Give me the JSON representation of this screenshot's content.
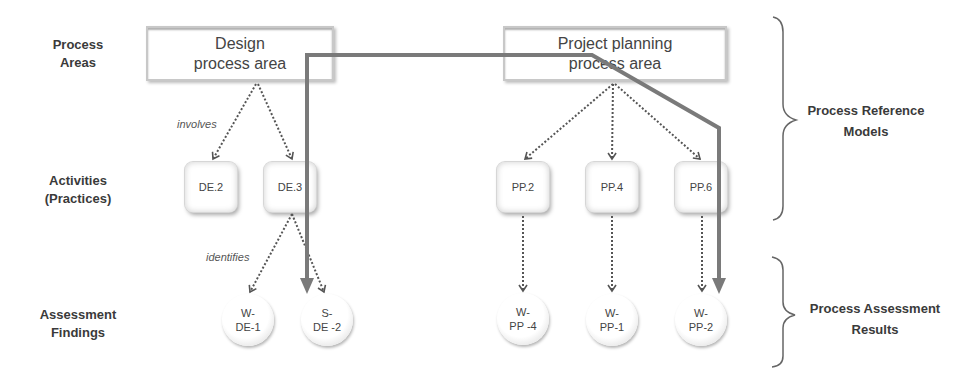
{
  "row_labels": {
    "process_areas": [
      "Process",
      "Areas"
    ],
    "activities": [
      "Activities",
      "(Practices)"
    ],
    "findings": [
      "Assessment",
      "Findings"
    ]
  },
  "process_areas": [
    {
      "id": "design",
      "lines": [
        "Design",
        "process area"
      ]
    },
    {
      "id": "project_planning",
      "lines": [
        "Project planning",
        "process area"
      ]
    }
  ],
  "activities": [
    {
      "id": "DE.2",
      "label": "DE.2",
      "parent": "design"
    },
    {
      "id": "DE.3",
      "label": "DE.3",
      "parent": "design"
    },
    {
      "id": "PP.2",
      "label": "PP.2",
      "parent": "project_planning"
    },
    {
      "id": "PP.4",
      "label": "PP.4",
      "parent": "project_planning"
    },
    {
      "id": "PP.6",
      "label": "PP.6",
      "parent": "project_planning"
    }
  ],
  "findings": [
    {
      "id": "W-DE-1",
      "lines": [
        "W-",
        "DE-1"
      ],
      "source": "DE.3"
    },
    {
      "id": "S-DE-2",
      "lines": [
        "S-",
        "DE -2"
      ],
      "source": "DE.3"
    },
    {
      "id": "W-PP-4",
      "lines": [
        "W-",
        "PP -4"
      ],
      "source": "PP.2"
    },
    {
      "id": "W-PP-1",
      "lines": [
        "W-",
        "PP-1"
      ],
      "source": "PP.4"
    },
    {
      "id": "W-PP-2",
      "lines": [
        "W-",
        "PP-2"
      ],
      "source": "PP.6"
    }
  ],
  "edge_labels": {
    "involves": "involves",
    "identifies": "identifies"
  },
  "group_labels": {
    "reference_models": [
      "Process Reference",
      "Models"
    ],
    "assessment_results": [
      "Process Assessment",
      "Results"
    ]
  },
  "colors": {
    "thick_path": "#7a7a7a",
    "dotted_arrow": "#555555",
    "brace": "#666666",
    "box_border": "#c8c8c8"
  }
}
